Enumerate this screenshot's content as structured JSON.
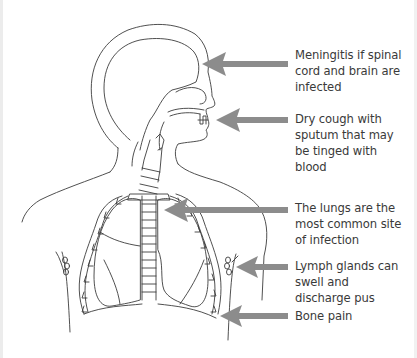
{
  "diagram": {
    "arrow_color": "#8c8c8c",
    "line_color": "#3c3c3c",
    "annotations": [
      {
        "id": "meningitis",
        "text": "Meningitis if spinal cord and brain are infected",
        "lines": [
          "Meningitis if spinal",
          "cord and brain are",
          "infected"
        ],
        "points_to": "brain"
      },
      {
        "id": "cough",
        "text": "Dry cough with sputum that may be tinged with blood",
        "lines": [
          "Dry cough with",
          "sputum that may",
          "be tinged with",
          "blood"
        ],
        "points_to": "mouth"
      },
      {
        "id": "lungs",
        "text": "The lungs are the most common site of infection",
        "lines": [
          "The lungs are the",
          "most common site",
          "of infection"
        ],
        "points_to": "lungs"
      },
      {
        "id": "lymph",
        "text": "Lymph glands can swell and discharge pus",
        "lines": [
          "Lymph glands can",
          "swell and",
          "discharge pus"
        ],
        "points_to": "lymph glands"
      },
      {
        "id": "bone",
        "text": "Bone pain",
        "lines": [
          "Bone pain"
        ],
        "points_to": "ribs"
      }
    ]
  }
}
